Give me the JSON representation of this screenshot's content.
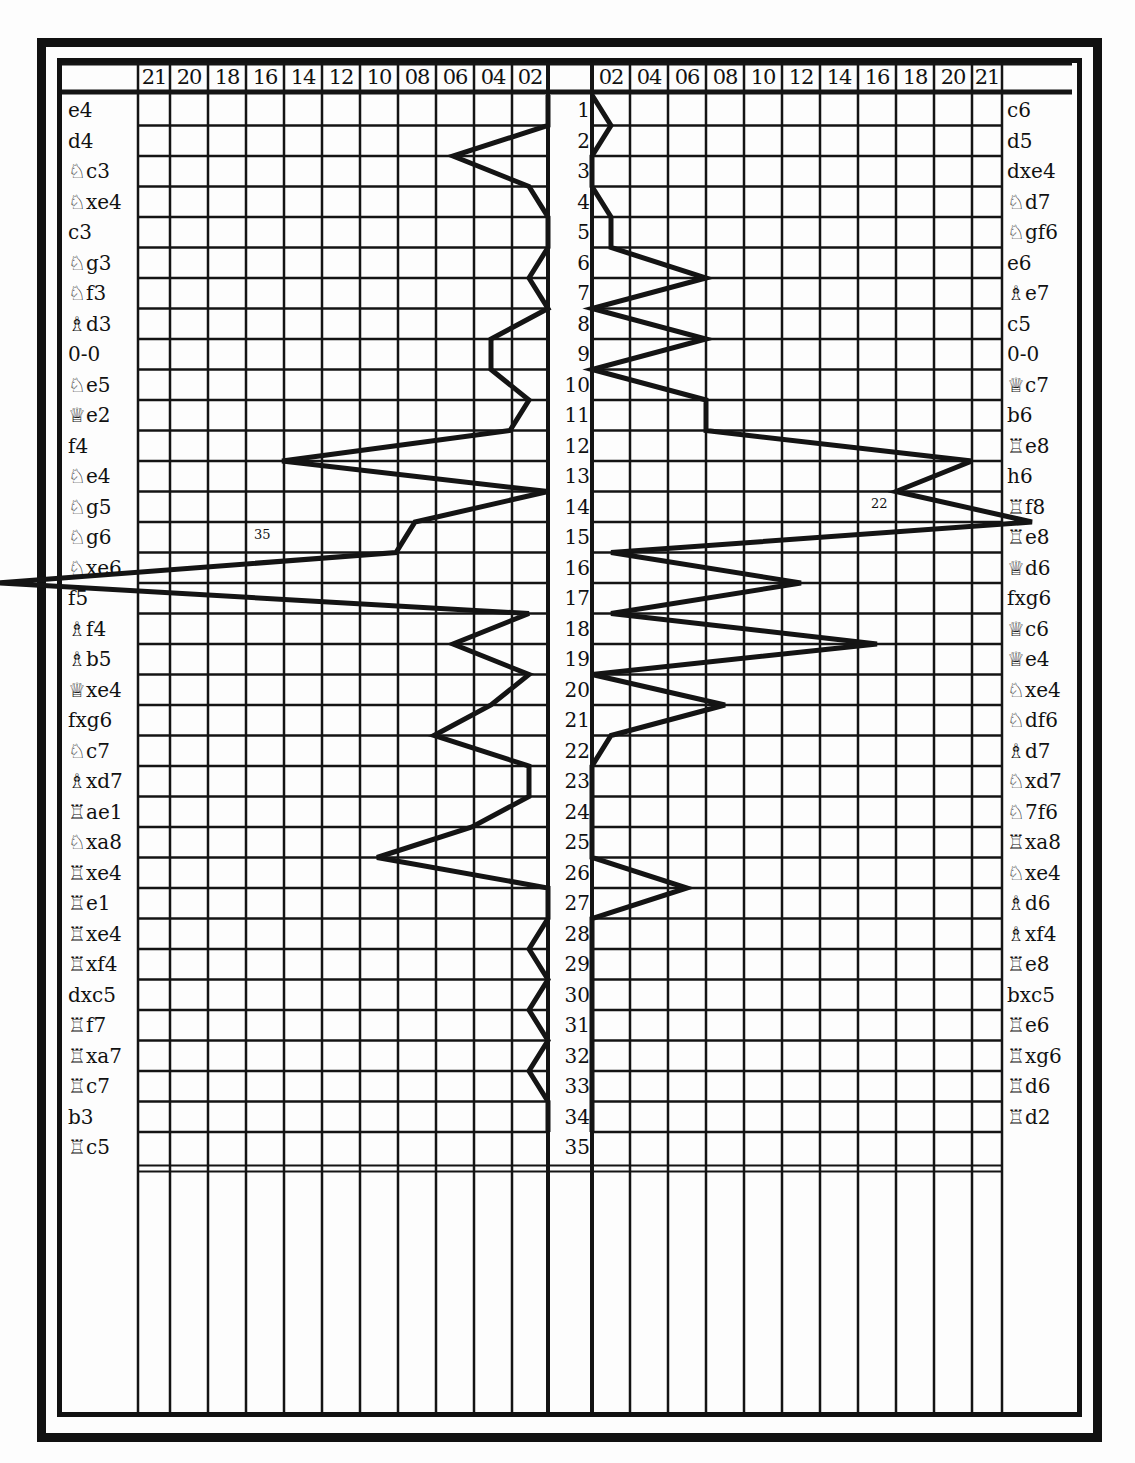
{
  "chart_data": {
    "type": "line",
    "title": "",
    "layout": "butterfly (mirrored) chart, moves 1-35 as rows down the center",
    "row_labels": [
      "1",
      "2",
      "3",
      "4",
      "5",
      "6",
      "7",
      "8",
      "9",
      "10",
      "11",
      "12",
      "13",
      "14",
      "15",
      "16",
      "17",
      "18",
      "19",
      "20",
      "21",
      "22",
      "23",
      "24",
      "25",
      "26",
      "27",
      "28",
      "29",
      "30",
      "31",
      "32",
      "33",
      "34",
      "35"
    ],
    "left_axis_ticks": [
      "21",
      "20",
      "18",
      "16",
      "14",
      "12",
      "10",
      "08",
      "06",
      "04",
      "02"
    ],
    "right_axis_ticks": [
      "02",
      "04",
      "06",
      "08",
      "10",
      "12",
      "14",
      "16",
      "18",
      "20",
      "21"
    ],
    "annotations": [
      {
        "side": "left",
        "text": "35",
        "row": 15,
        "note": "off-scale value on move 15"
      },
      {
        "side": "right",
        "text": "22",
        "row": 14,
        "note": "off-scale value on move 14"
      }
    ],
    "series": [
      {
        "name": "White",
        "side": "left",
        "moves": [
          "e4",
          "d4",
          "♘c3",
          "♘xe4",
          "c3",
          "♘g3",
          "♘f3",
          "♗d3",
          "0-0",
          "♘e5",
          "♕e2",
          "f4",
          "♘e4",
          "♘g5",
          "♘g6",
          "♘xe6",
          "f5",
          "♗f4",
          "♗b5",
          "♕xe4",
          "fxg6",
          "♘c7",
          "♗xd7",
          "♖ae1",
          "♘xa8",
          "♖xe4",
          "♖e1",
          "♖xe4",
          "♖xf4",
          "dxc5",
          "♖f7",
          "♖xa7",
          "♖c7",
          "b3",
          "♖c5"
        ],
        "values": [
          0,
          5,
          1,
          0,
          0,
          1,
          0,
          3,
          3,
          1,
          2,
          14,
          0,
          7,
          8,
          35,
          1,
          5,
          1,
          3,
          6,
          1,
          1,
          4,
          9,
          0,
          0,
          1,
          0,
          1,
          0,
          1,
          0,
          0,
          1
        ]
      },
      {
        "name": "Black",
        "side": "right",
        "moves": [
          "c6",
          "d5",
          "dxe4",
          "♘d7",
          "♘gf6",
          "e6",
          "♗e7",
          "c5",
          "0-0",
          "♕c7",
          "b6",
          "♖e8",
          "h6",
          "♖f8",
          "♖e8",
          "♕d6",
          "fxg6",
          "♕c6",
          "♕e4",
          "♘xe4",
          "♘df6",
          "♗d7",
          "♘xd7",
          "♘7f6",
          "♖xa8",
          "♘xe4",
          "♗d6",
          "♗xf4",
          "♖e8",
          "bxc5",
          "♖e6",
          "♖xg6",
          "♖d6",
          "♖d2"
        ],
        "values": [
          1,
          0,
          0,
          1,
          1,
          6,
          0,
          6,
          0,
          6,
          6,
          20,
          16,
          22,
          1,
          11,
          1,
          15,
          0,
          7,
          1,
          0,
          0,
          0,
          0,
          5,
          0,
          0,
          0,
          0,
          0,
          0,
          0,
          0
        ]
      }
    ]
  },
  "header": {
    "left_ticks": [
      "21",
      "20",
      "18",
      "16",
      "14",
      "12",
      "10",
      "08",
      "06",
      "04",
      "02"
    ],
    "right_ticks": [
      "02",
      "04",
      "06",
      "08",
      "10",
      "12",
      "14",
      "16",
      "18",
      "20",
      "21"
    ]
  },
  "left_moves": [
    "e4",
    "d4",
    "♘c3",
    "♘xe4",
    "c3",
    "♘g3",
    "♘f3",
    "♗d3",
    "0-0",
    "♘e5",
    "♕e2",
    "f4",
    "♘e4",
    "♘g5",
    "♘g6",
    "♘xe6",
    "f5",
    "♗f4",
    "♗b5",
    "♕xe4",
    "fxg6",
    "♘c7",
    "♗xd7",
    "♖ae1",
    "♘xa8",
    "♖xe4",
    "♖e1",
    "♖xe4",
    "♖xf4",
    "dxc5",
    "♖f7",
    "♖xa7",
    "♖c7",
    "b3",
    "♖c5"
  ],
  "right_moves": [
    "c6",
    "d5",
    "dxe4",
    "♘d7",
    "♘gf6",
    "e6",
    "♗e7",
    "c5",
    "0-0",
    "♕c7",
    "b6",
    "♖e8",
    "h6",
    "♖f8",
    "♖e8",
    "♕d6",
    "fxg6",
    "♕c6",
    "♕e4",
    "♘xe4",
    "♘df6",
    "♗d7",
    "♘xd7",
    "♘7f6",
    "♖xa8",
    "♘xe4",
    "♗d6",
    "♗xf4",
    "♖e8",
    "bxc5",
    "♖e6",
    "♖xg6",
    "♖d6",
    "♖d2"
  ],
  "move_numbers": [
    "1",
    "2",
    "3",
    "4",
    "5",
    "6",
    "7",
    "8",
    "9",
    "10",
    "11",
    "12",
    "13",
    "14",
    "15",
    "16",
    "17",
    "18",
    "19",
    "20",
    "21",
    "22",
    "23",
    "24",
    "25",
    "26",
    "27",
    "28",
    "29",
    "30",
    "31",
    "32",
    "33",
    "34",
    "35"
  ],
  "annotations": {
    "left": "35",
    "right": "22"
  }
}
